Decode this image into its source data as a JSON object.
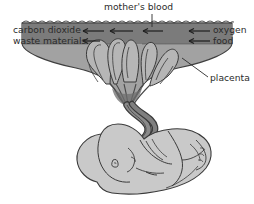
{
  "diagram": {
    "background_color": "#ffffff",
    "line_color": "#3a3a3a",
    "labels": {
      "top": "mother's blood",
      "left_1": "carbon dioxide",
      "left_2": "waste materials",
      "right_1": "oxygen",
      "right_2": "food",
      "placenta": "placenta"
    },
    "colors": {
      "uterine_wall": "#8e8e8e",
      "maternal_blood_band": "#7a7a7a",
      "placenta_body": "#a2a2a2",
      "villi_fill": "#b4b4b4",
      "cord": "#6e6e6e",
      "fetus_fill": "#c9c9c9",
      "text": "#2b2b2b"
    },
    "arrows": {
      "outward_direction": "left",
      "inward_direction": "left",
      "outward_count": 3,
      "inward_count": 2
    }
  }
}
